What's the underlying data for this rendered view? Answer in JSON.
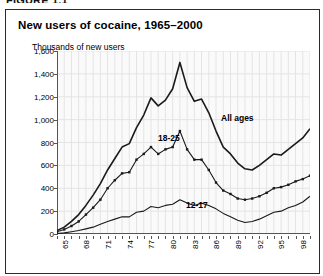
{
  "figure_kicker": "FIGURE 1.1",
  "chart": {
    "title": "New users of cocaine, 1965–2000",
    "y_axis_title": "Thousands of new users"
  },
  "labels": {
    "all_ages": "All ages",
    "age_18_25": "18-25",
    "age_12_17": "12-17"
  },
  "colors": {
    "line": "#1a1a1a",
    "plot_background": "#fafafa",
    "grid": "#e4e4e4",
    "frame": "#2b2b2b"
  },
  "chart_data": {
    "type": "line",
    "title": "New users of cocaine, 1965–2000",
    "xlabel": "",
    "ylabel": "Thousands of new users",
    "ylim": [
      0,
      1600
    ],
    "ytick_labels": [
      "0",
      "200",
      "400",
      "600",
      "800",
      "1,000",
      "1,200",
      "1,400",
      "1,600"
    ],
    "yticks": [
      0,
      200,
      400,
      600,
      800,
      1000,
      1200,
      1400,
      1600
    ],
    "xlim": [
      1965,
      2000
    ],
    "xtick_labels": [
      "65",
      "68",
      "71",
      "74",
      "77",
      "80",
      "83",
      "86",
      "89",
      "92",
      "95",
      "98"
    ],
    "xticks": [
      1965,
      1968,
      1971,
      1974,
      1977,
      1980,
      1983,
      1986,
      1989,
      1992,
      1995,
      1998
    ],
    "grid": true,
    "legend": "inline-annotations",
    "x": [
      1965,
      1966,
      1967,
      1968,
      1969,
      1970,
      1971,
      1972,
      1973,
      1974,
      1975,
      1976,
      1977,
      1978,
      1979,
      1980,
      1981,
      1982,
      1983,
      1984,
      1985,
      1986,
      1987,
      1988,
      1989,
      1990,
      1991,
      1992,
      1993,
      1994,
      1995,
      1996,
      1997,
      1998,
      1999,
      2000
    ],
    "series": [
      {
        "name": "All ages",
        "marker": "none",
        "values": [
          30,
          60,
          110,
          170,
          250,
          340,
          440,
          560,
          660,
          760,
          790,
          930,
          1040,
          1190,
          1120,
          1170,
          1270,
          1500,
          1280,
          1160,
          1180,
          1060,
          900,
          760,
          700,
          620,
          570,
          560,
          600,
          650,
          700,
          690,
          740,
          790,
          840,
          920
        ]
      },
      {
        "name": "18-25",
        "marker": "square",
        "values": [
          20,
          40,
          70,
          110,
          170,
          230,
          300,
          400,
          470,
          530,
          540,
          650,
          700,
          760,
          700,
          740,
          760,
          900,
          740,
          650,
          650,
          560,
          450,
          380,
          350,
          310,
          300,
          310,
          330,
          360,
          400,
          410,
          430,
          460,
          480,
          510
        ]
      },
      {
        "name": "12-17",
        "marker": "none",
        "values": [
          5,
          10,
          20,
          30,
          45,
          60,
          85,
          110,
          130,
          150,
          150,
          190,
          200,
          240,
          230,
          250,
          260,
          300,
          270,
          250,
          270,
          250,
          220,
          180,
          150,
          120,
          100,
          110,
          130,
          160,
          190,
          200,
          230,
          250,
          280,
          330
        ]
      }
    ]
  }
}
